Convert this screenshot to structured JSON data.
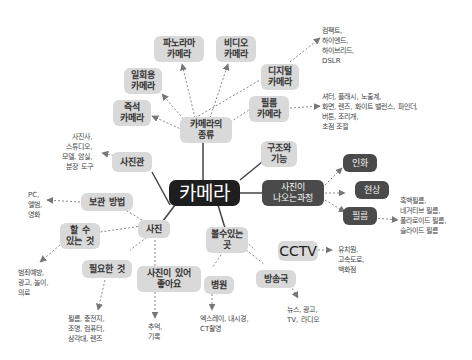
{
  "center": {
    "label": "카메라"
  },
  "branches": {
    "types": {
      "label": "카메라의\n종류",
      "children": {
        "panorama": "파노라마\n카메라",
        "video": "비디오\n카메라",
        "disposable": "일회용\n카메라",
        "instant": "즉석\n카메라",
        "digital": "디지털\n카메라",
        "film": "필름\n카메라"
      },
      "digital_leaf": "컴팩트,\n하이엔드,\n하이브리드,\nDSLR",
      "film_leaf": "셔터, 플래시, 노출계,\n화면, 렌즈, 화이트 밸런스, 파인더,\n버튼, 조리개,\n초점 조절"
    },
    "studio": {
      "label": "사진관",
      "leaf": "사진사,\n스튜디오,\n모델, 암실,\n분장 도구"
    },
    "structure": {
      "label": "구조와\n기능"
    },
    "process": {
      "label": "사진이\n나오는과정",
      "children": {
        "print": "인화",
        "develop": "현상",
        "film": "필름"
      },
      "film_leaf": "흑백필름,\n네거티브 필름,\n폴라로이드 필름,\n슬라이드 필름"
    },
    "photo": {
      "label": "사진",
      "children": {
        "storage": "보관 방법",
        "can_do": "할 수\n있는 것",
        "needed": "필요한 것",
        "good": "사진이 있어\n좋아요"
      },
      "storage_leaf": "PC,\n앨범,\n영화",
      "can_do_leaf": "범죄예방,\n광고, 놀이,\n의료",
      "needed_leaf": "필름, 충전지,\n조명, 컴퓨터,\n삼각대, 렌즈",
      "good_leaf": "추억,\n기록"
    },
    "must_see": {
      "label": "볼수있는\n곳",
      "children": {
        "cctv": "CCTV",
        "hospital": "병원",
        "broadcast": "방송국"
      },
      "cctv_leaf": "유치원,\n고속도로,\n백화점",
      "hospital_leaf": "엑스레이, 내시경,\nCT촬영",
      "broadcast_leaf": "뉴스, 광고,\nTV, 라디오"
    }
  },
  "colors": {
    "light_node": "#d9d9d9",
    "dark_node": "#4a4a4a",
    "center_node": "#1e1e1e",
    "line": "#555555"
  }
}
